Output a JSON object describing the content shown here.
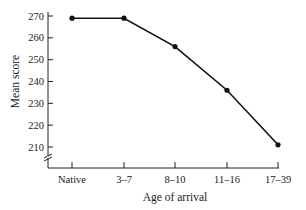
{
  "chart_data": {
    "type": "line",
    "title": "",
    "xlabel": "Age of arrival",
    "ylabel": "Mean score",
    "categories": [
      "Native",
      "3–7",
      "8–10",
      "11–16",
      "17–39"
    ],
    "series": [
      {
        "name": "Mean score",
        "values": [
          269,
          269,
          256,
          236,
          211
        ]
      }
    ],
    "yticks": [
      210,
      220,
      230,
      240,
      250,
      260,
      270
    ],
    "ylim": [
      210,
      270
    ],
    "y_axis_break": true,
    "grid": false,
    "legend": "none"
  }
}
